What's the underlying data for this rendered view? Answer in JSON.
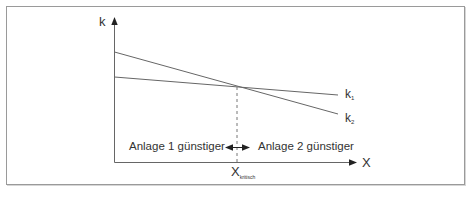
{
  "diagram": {
    "axes": {
      "y_label": "k",
      "x_label": "X"
    },
    "curves": [
      {
        "id": "k1",
        "label_main": "k",
        "label_sub": "1",
        "description": "flatter cost line, starts lower"
      },
      {
        "id": "k2",
        "label_main": "k",
        "label_sub": "2",
        "description": "steeper cost line, starts higher"
      }
    ],
    "critical_point": {
      "label_main": "X",
      "label_sub": "kritisch"
    },
    "regions": {
      "left": "Anlage 1 günstiger",
      "right": "Anlage 2 günstiger"
    },
    "colors": {
      "line": "#555555",
      "text": "#333333",
      "frame": "#9a9a9a"
    }
  }
}
